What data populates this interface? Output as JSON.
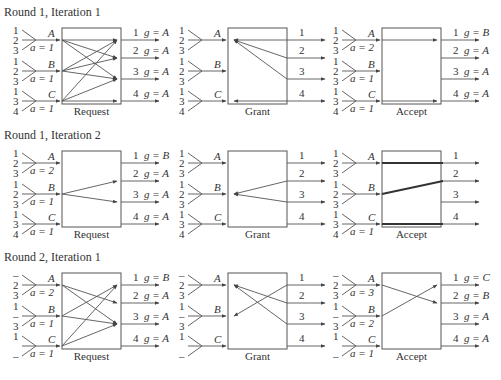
{
  "figure": {
    "rows": [
      {
        "title": "Round 1, Iteration 1",
        "inputs": [
          {
            "name": "A",
            "labels": [
              "1",
              "2",
              "3"
            ],
            "accept": "a = 1"
          },
          {
            "name": "B",
            "labels": [
              "1",
              "2",
              "3"
            ],
            "accept": "a = 1"
          },
          {
            "name": "C",
            "labels": [
              "1",
              "3",
              "4"
            ],
            "accept": "a = 1"
          }
        ],
        "outputs": [
          {
            "port": "1",
            "grant": "g = A"
          },
          {
            "port": "2",
            "grant": "g = A"
          },
          {
            "port": "3",
            "grant": "g = A"
          },
          {
            "port": "4",
            "grant": "g = A"
          }
        ],
        "panels": [
          {
            "label": "Request",
            "arrows": [
              [
                "A",
                "1"
              ],
              [
                "A",
                "2"
              ],
              [
                "A",
                "3"
              ],
              [
                "B",
                "1"
              ],
              [
                "B",
                "2"
              ],
              [
                "B",
                "3"
              ],
              [
                "C",
                "1"
              ],
              [
                "C",
                "3"
              ],
              [
                "C",
                "4"
              ]
            ]
          },
          {
            "label": "Grant",
            "arrows": [
              [
                "1",
                "A"
              ],
              [
                "2",
                "A"
              ],
              [
                "3",
                "A"
              ],
              [
                "4",
                "C"
              ]
            ]
          },
          {
            "label": "Accept",
            "arrows": [
              [
                "A",
                "1"
              ],
              [
                "C",
                "4"
              ]
            ]
          }
        ],
        "accept_outputs": [
          {
            "port": "1",
            "grant": "g = B"
          },
          {
            "port": "2",
            "grant": "g = A"
          },
          {
            "port": "3",
            "grant": "g = A"
          },
          {
            "port": "4",
            "grant": "g = A"
          }
        ],
        "accept_inputs": [
          "a = 2",
          "a = 1",
          "a = 1"
        ]
      },
      {
        "title": "Round 1, Iteration 2",
        "inputs": [
          {
            "name": "A",
            "labels": [
              "1",
              "2",
              "3"
            ],
            "accept": "a = 2"
          },
          {
            "name": "B",
            "labels": [
              "1",
              "2",
              "3"
            ],
            "accept": "a = 1"
          },
          {
            "name": "C",
            "labels": [
              "1",
              "3",
              "4"
            ],
            "accept": "a = 1"
          }
        ],
        "outputs": [
          {
            "port": "1",
            "grant": "g = B"
          },
          {
            "port": "2",
            "grant": "g = A"
          },
          {
            "port": "3",
            "grant": "g = A"
          },
          {
            "port": "4",
            "grant": "g = A"
          }
        ],
        "panels": [
          {
            "label": "Request",
            "arrows": [
              [
                "B",
                "2"
              ],
              [
                "B",
                "3"
              ]
            ]
          },
          {
            "label": "Grant",
            "arrows": [
              [
                "2",
                "B"
              ],
              [
                "3",
                "B"
              ]
            ]
          },
          {
            "label": "Accept",
            "arrows": [
              [
                "A",
                "1"
              ],
              [
                "B",
                "2"
              ],
              [
                "C",
                "4"
              ]
            ]
          }
        ],
        "accept_outputs": [
          {
            "port": "1",
            "grant": ""
          },
          {
            "port": "2",
            "grant": ""
          },
          {
            "port": "3",
            "grant": ""
          },
          {
            "port": "4",
            "grant": ""
          }
        ],
        "accept_inputs": [
          "",
          "",
          "a = 1"
        ]
      },
      {
        "title": "Round 2, Iteration 1",
        "inputs": [
          {
            "name": "A",
            "labels": [
              "–",
              "2",
              "3"
            ],
            "accept": "a = 2"
          },
          {
            "name": "B",
            "labels": [
              "1",
              "–",
              "3"
            ],
            "accept": "a = 1"
          },
          {
            "name": "C",
            "labels": [
              "1",
              "",
              "–"
            ],
            "accept": "a = 1"
          }
        ],
        "outputs": [
          {
            "port": "1",
            "grant": "g = B"
          },
          {
            "port": "2",
            "grant": "g = A"
          },
          {
            "port": "3",
            "grant": "g = A"
          },
          {
            "port": "4",
            "grant": "g = A"
          }
        ],
        "panels": [
          {
            "label": "Request",
            "arrows": [
              [
                "A",
                "2"
              ],
              [
                "A",
                "3"
              ],
              [
                "B",
                "1"
              ],
              [
                "B",
                "3"
              ],
              [
                "C",
                "1"
              ],
              [
                "C",
                "3"
              ]
            ]
          },
          {
            "label": "Grant",
            "arrows": [
              [
                "1",
                "B"
              ],
              [
                "2",
                "A"
              ],
              [
                "3",
                "A"
              ]
            ]
          },
          {
            "label": "Accept",
            "arrows": [
              [
                "A",
                "2"
              ],
              [
                "B",
                "1"
              ]
            ]
          }
        ],
        "accept_outputs": [
          {
            "port": "1",
            "grant": "g = C"
          },
          {
            "port": "2",
            "grant": "g = B"
          },
          {
            "port": "3",
            "grant": "g = A"
          },
          {
            "port": "4",
            "grant": "g = A"
          }
        ],
        "accept_inputs": [
          "a = 3",
          "a = 2",
          "a = 1"
        ]
      }
    ]
  }
}
